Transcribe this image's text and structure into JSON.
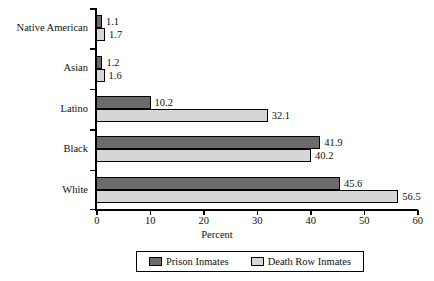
{
  "chart_data": {
    "type": "bar",
    "orientation": "horizontal",
    "title": "",
    "xlabel": "Percent",
    "ylabel": "",
    "xlim": [
      0,
      60
    ],
    "xticks": [
      0,
      10,
      20,
      30,
      40,
      50,
      60
    ],
    "xtick_labels": [
      "0",
      "10",
      "20",
      "30",
      "40",
      "50",
      "60"
    ],
    "grid": false,
    "legend_position": "bottom",
    "categories": [
      "Native American",
      "Asian",
      "Latino",
      "Black",
      "White"
    ],
    "series": [
      {
        "name": "Prison Inmates",
        "color": "#6b6b6b",
        "values": [
          1.1,
          1.2,
          10.2,
          41.9,
          45.6
        ],
        "value_labels": [
          "1.1",
          "1.2",
          "10.2",
          "41.9",
          "45.6"
        ]
      },
      {
        "name": "Death Row Inmates",
        "color": "#d6d6d6",
        "values": [
          1.7,
          1.6,
          32.1,
          40.2,
          56.5
        ],
        "value_labels": [
          "1.7",
          "1.6",
          "32.1",
          "40.2",
          "56.5"
        ]
      }
    ]
  },
  "legend": {
    "items": [
      {
        "label": "Prison Inmates",
        "color": "#6b6b6b"
      },
      {
        "label": "Death Row Inmates",
        "color": "#d6d6d6"
      }
    ]
  },
  "axis": {
    "x_title": "Percent"
  },
  "colors": {
    "series_prison": "#6b6b6b",
    "series_death_row": "#d6d6d6",
    "axis": "#000000",
    "text": "#111111",
    "background": "#ffffff"
  }
}
